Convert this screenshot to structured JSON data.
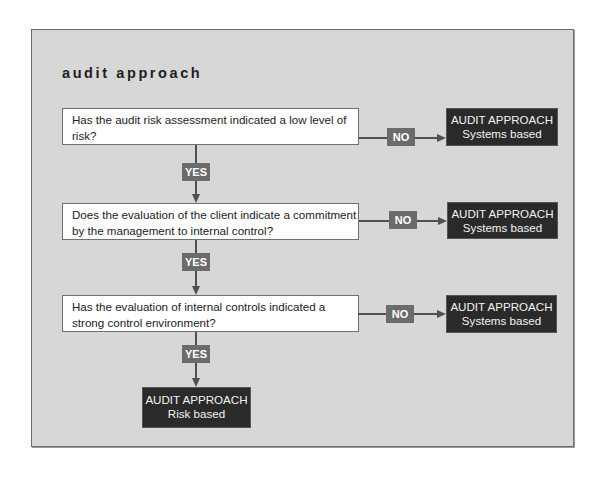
{
  "diagram": {
    "title": "audit approach",
    "questions": [
      {
        "text": "Has the audit risk assessment indicated a low level of risk?"
      },
      {
        "text": "Does the evaluation of the client indicate a commitment by the management to internal control?"
      },
      {
        "text": "Has the evaluation of internal controls indicated a strong control environment?"
      }
    ],
    "no_label": "NO",
    "yes_label": "YES",
    "outcomes": {
      "no": [
        {
          "heading": "AUDIT APPROACH",
          "subtitle": "Systems based"
        },
        {
          "heading": "AUDIT APPROACH",
          "subtitle": "Systems based"
        },
        {
          "heading": "AUDIT APPROACH",
          "subtitle": "Systems based"
        }
      ],
      "final_yes": {
        "heading": "AUDIT APPROACH",
        "subtitle": "Risk based"
      }
    },
    "colors": {
      "panel_bg": "#d7d7d7",
      "question_bg": "#ffffff",
      "outcome_bg": "#2a2a2a",
      "badge_bg": "#6b6b6b",
      "connector": "#505050"
    }
  }
}
